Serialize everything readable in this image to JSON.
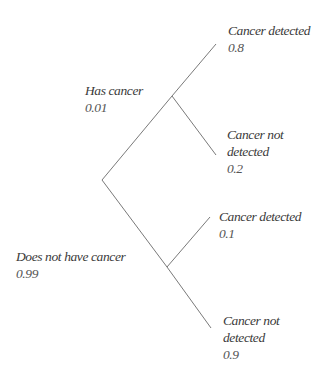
{
  "diagram": {
    "type": "probability-tree",
    "root": {
      "branches": [
        {
          "label": "Has cancer",
          "probability": "0.01",
          "branches": [
            {
              "label": "Cancer detected",
              "probability": "0.8"
            },
            {
              "label_line1": "Cancer not",
              "label_line2": "detected",
              "probability": "0.2"
            }
          ]
        },
        {
          "label": "Does not have cancer",
          "probability": "0.99",
          "branches": [
            {
              "label": "Cancer detected",
              "probability": "0.1"
            },
            {
              "label_line1": "Cancer not",
              "label_line2": "detected",
              "probability": "0.9"
            }
          ]
        }
      ]
    },
    "colors": {
      "line": "#6a6a6a",
      "text": "#3a3a3a",
      "background": "#ffffff"
    }
  }
}
